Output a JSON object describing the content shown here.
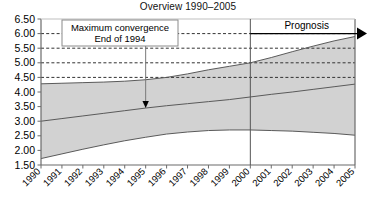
{
  "chart_data": {
    "type": "area",
    "title": "Overview 1990–2005",
    "xlabel": "",
    "ylabel": "",
    "ylim": [
      1.5,
      6.5
    ],
    "ytick_step": 0.5,
    "ytick_labels": [
      "6.50",
      "6.00",
      "5.50",
      "5.00",
      "4.50",
      "4.00",
      "3.50",
      "3.00",
      "2.50",
      "2.00",
      "1.50"
    ],
    "grid": "horizontal-dashed-partial",
    "gridlines_dashed_at": [
      6.0,
      5.5,
      5.0,
      4.5
    ],
    "legend": "none",
    "categories": [
      "1990",
      "1991",
      "1992",
      "1993",
      "1994",
      "1995",
      "1996",
      "1997",
      "1998",
      "1999",
      "2000",
      "2001",
      "2002",
      "2003",
      "2004",
      "2005"
    ],
    "x": [
      1990,
      1991,
      1992,
      1993,
      1994,
      1995,
      1996,
      1997,
      1998,
      1999,
      2000,
      2001,
      2002,
      2003,
      2004,
      2005
    ],
    "series": [
      {
        "name": "Upper bound",
        "values": [
          4.28,
          4.3,
          4.32,
          4.34,
          4.37,
          4.42,
          4.5,
          4.62,
          4.76,
          4.88,
          5.0,
          5.18,
          5.38,
          5.57,
          5.75,
          5.9
        ]
      },
      {
        "name": "Middle trend",
        "values": [
          3.0,
          3.09,
          3.18,
          3.27,
          3.36,
          3.45,
          3.53,
          3.6,
          3.67,
          3.74,
          3.83,
          3.92,
          4.0,
          4.09,
          4.18,
          4.27
        ]
      },
      {
        "name": "Lower bound",
        "values": [
          1.72,
          1.88,
          2.04,
          2.19,
          2.33,
          2.45,
          2.56,
          2.63,
          2.68,
          2.7,
          2.7,
          2.68,
          2.66,
          2.62,
          2.58,
          2.52
        ]
      }
    ],
    "band": {
      "fill_color": "#d2d2d2",
      "between": [
        "Lower bound",
        "Upper bound"
      ]
    },
    "annotations": [
      {
        "name": "maximum-convergence-callout",
        "line1": "Maximum convergence",
        "line2": "End of 1994",
        "points_to_x": 1995,
        "points_to_y": 3.45
      },
      {
        "name": "prognosis-label",
        "text": "Prognosis",
        "arrow_from_x": 2000,
        "arrow_to_x": 2005,
        "arrow_y": 6.0
      }
    ],
    "divider": {
      "name": "prognosis-divider",
      "at_x": 2000,
      "color": "#555555"
    }
  },
  "colors": {
    "band_fill": "#d2d2d2",
    "line": "#5a5a5a",
    "axis": "#6b6b6b",
    "grid_dashed": "#333333",
    "callout_border": "#8a8a8a",
    "callout_bg": "#ffffff",
    "text": "#000000"
  }
}
